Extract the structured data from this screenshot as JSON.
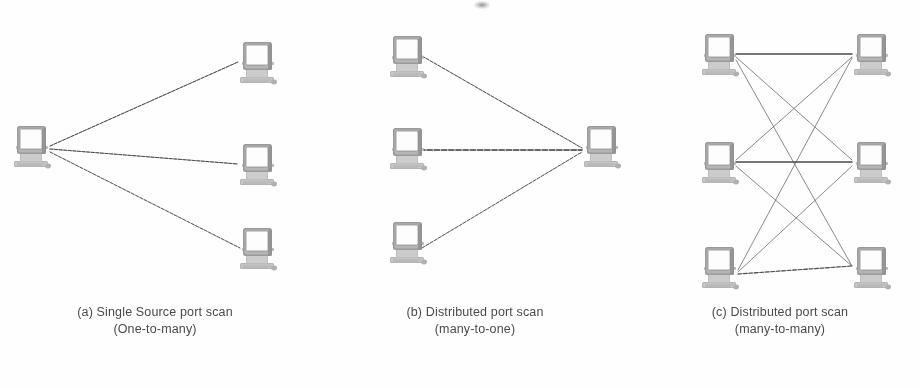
{
  "figure": {
    "width": 920,
    "height": 388,
    "background": "#fefefe",
    "ink_color": "#6e6e6e",
    "line_color": "#555555",
    "caption_color": "#4a4a4a"
  },
  "panels": [
    {
      "id": "panel-a",
      "label": "a",
      "caption_line1": "(a) Single Source port scan",
      "caption_line2": "(One-to-many)",
      "topology": "one-to-many",
      "left_x": 0,
      "width": 310,
      "source_nodes": [
        {
          "name": "source-host",
          "x": 12,
          "y": 122
        }
      ],
      "target_nodes": [
        {
          "name": "target-host-1",
          "x": 238,
          "y": 38
        },
        {
          "name": "target-host-2",
          "x": 238,
          "y": 140
        },
        {
          "name": "target-host-3",
          "x": 238,
          "y": 224
        }
      ],
      "edges": [
        {
          "from": "source-host",
          "to": "target-host-1",
          "style": "beaded"
        },
        {
          "from": "source-host",
          "to": "target-host-2",
          "style": "beaded"
        },
        {
          "from": "source-host",
          "to": "target-host-3",
          "style": "beaded"
        }
      ]
    },
    {
      "id": "panel-b",
      "label": "b",
      "caption_line1": "(b) Distributed port scan",
      "caption_line2": "(many-to-one)",
      "topology": "many-to-one",
      "left_x": 310,
      "width": 330,
      "source_nodes": [
        {
          "name": "scanner-host-1",
          "x": 78,
          "y": 32
        },
        {
          "name": "scanner-host-2",
          "x": 78,
          "y": 124
        },
        {
          "name": "scanner-host-3",
          "x": 78,
          "y": 218
        }
      ],
      "target_nodes": [
        {
          "name": "victim-host",
          "x": 272,
          "y": 122
        }
      ],
      "edges": [
        {
          "from": "scanner-host-1",
          "to": "victim-host",
          "style": "beaded"
        },
        {
          "from": "scanner-host-2",
          "to": "victim-host",
          "style": "beaded-heavy"
        },
        {
          "from": "scanner-host-3",
          "to": "victim-host",
          "style": "beaded"
        }
      ]
    },
    {
      "id": "panel-c",
      "label": "c",
      "caption_line1": "(c) Distributed port scan",
      "caption_line2": "(many-to-many)",
      "topology": "many-to-many",
      "left_x": 640,
      "width": 280,
      "source_nodes": [
        {
          "name": "scanner-host-1",
          "x": 60,
          "y": 30
        },
        {
          "name": "scanner-host-2",
          "x": 60,
          "y": 138
        },
        {
          "name": "scanner-host-3",
          "x": 60,
          "y": 243
        }
      ],
      "target_nodes": [
        {
          "name": "victim-host-1",
          "x": 212,
          "y": 30
        },
        {
          "name": "victim-host-2",
          "x": 212,
          "y": 138
        },
        {
          "name": "victim-host-3",
          "x": 212,
          "y": 243
        }
      ],
      "edges": [
        {
          "from": "scanner-host-1",
          "to": "victim-host-1",
          "style": "solid-heavy"
        },
        {
          "from": "scanner-host-1",
          "to": "victim-host-2",
          "style": "thin"
        },
        {
          "from": "scanner-host-1",
          "to": "victim-host-3",
          "style": "thin"
        },
        {
          "from": "scanner-host-2",
          "to": "victim-host-1",
          "style": "thin"
        },
        {
          "from": "scanner-host-2",
          "to": "victim-host-2",
          "style": "solid-heavy"
        },
        {
          "from": "scanner-host-2",
          "to": "victim-host-3",
          "style": "thin"
        },
        {
          "from": "scanner-host-3",
          "to": "victim-host-1",
          "style": "thin"
        },
        {
          "from": "scanner-host-3",
          "to": "victim-host-2",
          "style": "thin"
        },
        {
          "from": "scanner-host-3",
          "to": "victim-host-3",
          "style": "beaded"
        }
      ]
    }
  ],
  "icons": {
    "computer": "computer-monitor-icon"
  }
}
